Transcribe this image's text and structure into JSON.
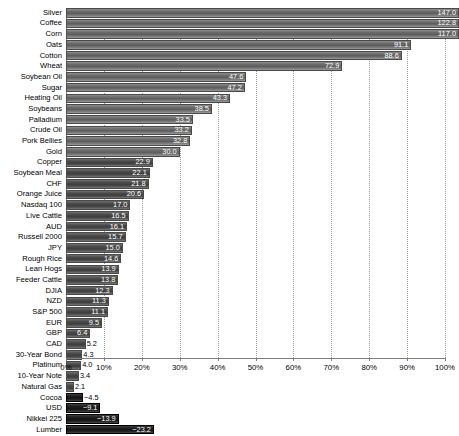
{
  "chart_data": {
    "type": "bar",
    "title": "",
    "subtitle": "",
    "xlabel": "",
    "ylabel": "",
    "orientation": "horizontal",
    "xlim": [
      0,
      100
    ],
    "xtick_labels": [
      "0%",
      "10%",
      "20%",
      "30%",
      "40%",
      "50%",
      "60%",
      "70%",
      "80%",
      "90%",
      "100%"
    ],
    "xticks": [
      0,
      10,
      20,
      30,
      40,
      50,
      60,
      70,
      80,
      90,
      100
    ],
    "grid": "vertical-dotted",
    "legend": "none",
    "value_suffix": "",
    "categories": [
      "Silver",
      "Coffee",
      "Corn",
      "Oats",
      "Cotton",
      "Wheat",
      "Soybean Oil",
      "Sugar",
      "Heating Oil",
      "Soybeans",
      "Palladium",
      "Crude Oil",
      "Pork Bellies",
      "Gold",
      "Copper",
      "Soybean Meal",
      "CHF",
      "Orange Juice",
      "Nasdaq 100",
      "Live Cattle",
      "AUD",
      "Russell 2000",
      "JPY",
      "Rough Rice",
      "Lean Hogs",
      "Feeder Cattle",
      "DJIA",
      "NZD",
      "S&P 500",
      "EUR",
      "GBP",
      "CAD",
      "30-Year Bond",
      "Platinum",
      "10-Year Note",
      "Natural Gas",
      "Cocoa",
      "USD",
      "Nikkei 225",
      "Lumber"
    ],
    "values": [
      147.0,
      122.8,
      117.0,
      91.1,
      88.6,
      72.9,
      47.6,
      47.2,
      43.3,
      38.5,
      33.5,
      33.2,
      32.8,
      30.0,
      22.9,
      22.1,
      21.8,
      20.6,
      17.0,
      16.5,
      16.1,
      15.7,
      15.0,
      14.6,
      13.9,
      13.8,
      12.3,
      11.3,
      11.1,
      9.5,
      6.4,
      5.2,
      4.3,
      4.0,
      3.4,
      2.1,
      -4.5,
      -9.1,
      -13.9,
      -23.2
    ],
    "value_labels": [
      "147.0",
      "122.8",
      "117.0",
      "91.1",
      "88.6",
      "72.9",
      "47.6",
      "47.2",
      "43.3",
      "38.5",
      "33.5",
      "33.2",
      "32.8",
      "30.0",
      "22.9",
      "22.1",
      "21.8",
      "20.6",
      "17.0",
      "16.5",
      "16.1",
      "15.7",
      "15.0",
      "14.6",
      "13.9",
      "13.8",
      "12.3",
      "11.3",
      "11.1",
      "9.5",
      "6.4",
      "5.2",
      "4.3",
      "4.0",
      "3.4",
      "2.1",
      "−4.5",
      "−9.1",
      "−13.9",
      "−23.2"
    ],
    "colors": {
      "bar_positive": "#6d6d6d",
      "bar_negative": "#1e1e1e",
      "grid": "#9a9a9a",
      "text": "#000000",
      "value_text_inside": "#ffffff",
      "background": "#ffffff"
    }
  }
}
